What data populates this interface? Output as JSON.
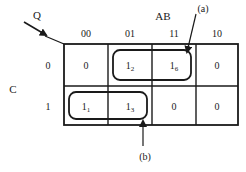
{
  "diagram": {
    "type": "karnaugh-map",
    "corner_arrow_label": "Q",
    "column_variable_label": "AB",
    "row_variable_label": "C",
    "column_headers": [
      "00",
      "01",
      "11",
      "10"
    ],
    "row_headers": [
      "0",
      "1"
    ],
    "cells": [
      [
        {
          "main": "0",
          "sub": ""
        },
        {
          "main": "1",
          "sub": "2"
        },
        {
          "main": "1",
          "sub": "6"
        },
        {
          "main": "0",
          "sub": ""
        }
      ],
      [
        {
          "main": "1",
          "sub": "1"
        },
        {
          "main": "1",
          "sub": "3"
        },
        {
          "main": "0",
          "sub": ""
        },
        {
          "main": "0",
          "sub": ""
        }
      ]
    ],
    "groups": [
      {
        "label": "(a)",
        "row": 0,
        "col_start": 1,
        "col_end": 2
      },
      {
        "label": "(b)",
        "row": 1,
        "col_start": 0,
        "col_end": 1
      }
    ]
  }
}
